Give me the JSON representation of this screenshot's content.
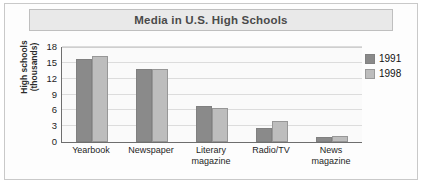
{
  "figure": {
    "title": "Media in U.S. High Schools"
  },
  "chart_data": {
    "type": "bar",
    "title": "Media in U.S. High Schools",
    "xlabel": "",
    "ylabel": "High schools (thousands)",
    "ylabel_line1": "High schools",
    "ylabel_line2": "(thousands)",
    "categories": [
      "Yearbook",
      "Newspaper",
      "Literary magazine",
      "Radio/TV",
      "News magazine"
    ],
    "category_lines": [
      [
        "Yearbook"
      ],
      [
        "Newspaper"
      ],
      [
        "Literary",
        "magazine"
      ],
      [
        "Radio/TV"
      ],
      [
        "News",
        "magazine"
      ]
    ],
    "series": [
      {
        "name": "1991",
        "color": "#8a8a8a",
        "values": [
          15.7,
          13.8,
          6.8,
          2.6,
          1.0
        ]
      },
      {
        "name": "1998",
        "color": "#bdbdbd",
        "values": [
          16.3,
          13.9,
          6.4,
          4.0,
          1.1
        ]
      }
    ],
    "ylim": [
      0,
      18
    ],
    "yticks": [
      18,
      15,
      12,
      9,
      6,
      3,
      0
    ],
    "grid": true,
    "legend_position": "right"
  }
}
